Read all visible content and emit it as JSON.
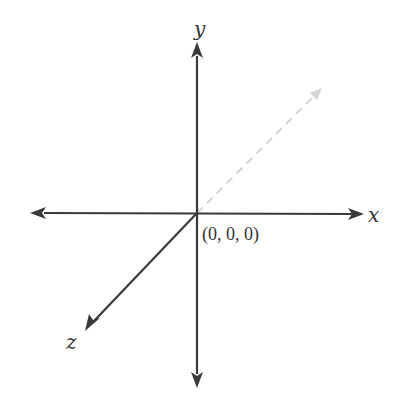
{
  "diagram": {
    "origin": {
      "label": "(0, 0, 0)",
      "px": [
        197,
        213
      ]
    },
    "axes": {
      "x": {
        "label": "x",
        "positive_tip": [
          364,
          214
        ],
        "negative_tip": [
          30,
          213
        ]
      },
      "y": {
        "label": "y",
        "positive_tip": [
          197,
          42
        ],
        "negative_tip": [
          197,
          388
        ]
      },
      "z": {
        "label": "z",
        "positive_tip": [
          85,
          331
        ]
      }
    },
    "dashed_axis": {
      "description": "negative z-axis direction (receding)",
      "tip": [
        322,
        88
      ]
    },
    "colors": {
      "axis": "#3a3a3a",
      "dashed": "#d4d4d4",
      "text": "#333333",
      "background": "#ffffff"
    }
  }
}
